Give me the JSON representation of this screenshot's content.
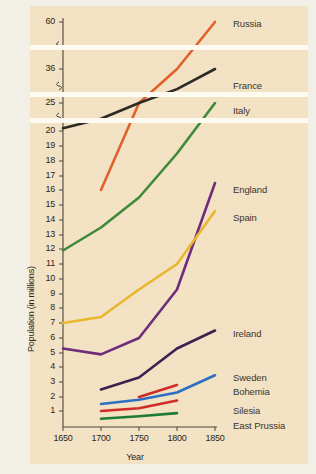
{
  "figure": {
    "background_color": "#f4e3c3",
    "page_color": "#f2f0e6",
    "break_band_color": "#fdfaf2"
  },
  "chart_data": {
    "type": "line",
    "title": "",
    "xlabel": "Year",
    "ylabel": "Population (in millions)",
    "xlim": [
      1650,
      1850
    ],
    "xticks": [
      1650,
      1700,
      1750,
      1800,
      1850
    ],
    "xticklabels": [
      "1650",
      "1700",
      "1750",
      "1800",
      "1850"
    ],
    "yticklabels": [
      "60",
      "36",
      "25",
      "20",
      "19",
      "18",
      "17",
      "16",
      "15",
      "14",
      "13",
      "12",
      "11",
      "10",
      "9",
      "8",
      "7",
      "6",
      "5",
      "4",
      "3",
      "2",
      "1"
    ],
    "yticks": [
      60,
      36,
      25,
      20,
      19,
      18,
      17,
      16,
      15,
      14,
      13,
      12,
      11,
      10,
      9,
      8,
      7,
      6,
      5,
      4,
      3,
      2,
      1
    ],
    "axis_breaks": [
      22.5,
      30.5,
      48
    ],
    "grid": false,
    "legend_position": "right-inline",
    "series": [
      {
        "name": "Russia",
        "color": "#e2602c",
        "label_y": 18,
        "points": [
          [
            1700,
            16.0
          ],
          [
            1750,
            25.0
          ],
          [
            1800,
            36.0
          ],
          [
            1850,
            60.0
          ]
        ]
      },
      {
        "name": "France",
        "color": "#2b2a25",
        "label_y": 80,
        "points": [
          [
            1650,
            20.5
          ],
          [
            1700,
            22.2
          ],
          [
            1750,
            25.0
          ],
          [
            1800,
            29.5
          ],
          [
            1850,
            36.0
          ]
        ]
      },
      {
        "name": "Italy",
        "color": "#3f8a3a",
        "label_y": 105,
        "points": [
          [
            1650,
            11.9
          ],
          [
            1700,
            13.5
          ],
          [
            1750,
            15.5
          ],
          [
            1800,
            18.5
          ],
          [
            1850,
            25.0
          ]
        ]
      },
      {
        "name": "England",
        "color": "#6d2d7a",
        "label_y": 184,
        "points": [
          [
            1650,
            5.3
          ],
          [
            1700,
            4.9
          ],
          [
            1750,
            6.0
          ],
          [
            1800,
            9.3
          ],
          [
            1850,
            16.5
          ]
        ]
      },
      {
        "name": "Spain",
        "color": "#e8b72c",
        "label_y": 212,
        "points": [
          [
            1650,
            7.0
          ],
          [
            1700,
            7.4
          ],
          [
            1750,
            9.3
          ],
          [
            1800,
            11.0
          ],
          [
            1850,
            14.6
          ]
        ]
      },
      {
        "name": "Ireland",
        "color": "#3d2050",
        "label_y": 328,
        "points": [
          [
            1700,
            2.5
          ],
          [
            1750,
            3.3
          ],
          [
            1800,
            5.3
          ],
          [
            1850,
            6.5
          ]
        ]
      },
      {
        "name": "Sweden",
        "color": "#2e6fc4",
        "label_y": 372,
        "points": [
          [
            1700,
            1.5
          ],
          [
            1750,
            1.8
          ],
          [
            1800,
            2.3
          ],
          [
            1850,
            3.45
          ]
        ]
      },
      {
        "name": "Bohemia",
        "color": "#cf2b28",
        "label_y": 386,
        "points": [
          [
            1750,
            2.0
          ],
          [
            1800,
            2.8
          ]
        ]
      },
      {
        "name": "Silesia",
        "color": "#cf2b28",
        "label_y": 405,
        "points": [
          [
            1700,
            1.0
          ],
          [
            1750,
            1.2
          ],
          [
            1800,
            1.75
          ]
        ]
      },
      {
        "name": "East Prussia",
        "color": "#1e7a35",
        "label_y": 420,
        "points": [
          [
            1700,
            0.45
          ],
          [
            1750,
            0.62
          ],
          [
            1800,
            0.85
          ]
        ]
      }
    ]
  }
}
